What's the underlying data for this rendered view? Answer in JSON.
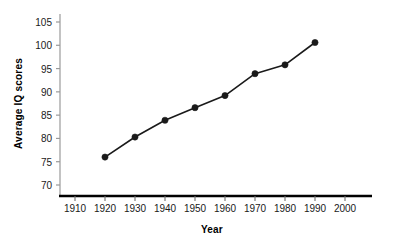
{
  "chart_data": {
    "type": "line",
    "title": "",
    "xlabel": "Year",
    "ylabel": "Average IQ scores",
    "x": [
      1920,
      1930,
      1940,
      1950,
      1960,
      1970,
      1980,
      1990
    ],
    "values": [
      76.0,
      80.3,
      83.9,
      86.6,
      89.2,
      93.9,
      95.8,
      100.6
    ],
    "series": [
      {
        "name": "Average IQ scores",
        "x": [
          1920,
          1930,
          1940,
          1950,
          1960,
          1970,
          1980,
          1990
        ],
        "values": [
          76.0,
          80.3,
          83.9,
          86.6,
          89.2,
          93.9,
          95.8,
          100.6
        ]
      }
    ],
    "xlim": [
      1905,
      2003
    ],
    "ylim": [
      68,
      107
    ],
    "xticks": [
      1910,
      1920,
      1930,
      1940,
      1950,
      1960,
      1970,
      1980,
      1990,
      2000
    ],
    "xtick_labels": [
      "1910",
      "1920",
      "1930",
      "1940",
      "1950",
      "1960",
      "1970",
      "1980",
      "1990",
      "2000"
    ],
    "yticks": [
      70,
      75,
      80,
      85,
      90,
      95,
      100,
      105
    ],
    "ytick_labels": [
      "70",
      "75",
      "80",
      "85",
      "90",
      "95",
      "100",
      "105"
    ],
    "grid": false,
    "legend": false,
    "marker": "filled-circle",
    "line_color": "#1a1a1a",
    "marker_color": "#1a1a1a",
    "axis_color": "#000000",
    "y_axis_color": "#9a9a9a",
    "background_color": "#ffffff"
  }
}
